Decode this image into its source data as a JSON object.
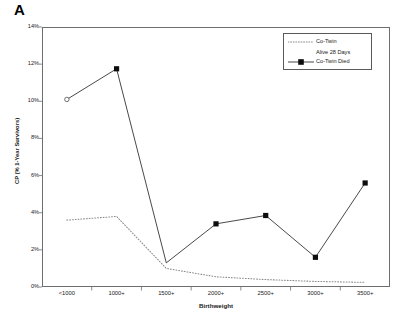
{
  "figure": {
    "panel_label": "A"
  },
  "legend": {
    "position": "top-right",
    "entries": [
      {
        "label_line1": "Co-Twin",
        "label_line2": "Alive 28 Days",
        "style": "dotted",
        "marker": "none"
      },
      {
        "label_line1": "Co-Twin Died",
        "label_line2": "",
        "style": "solid",
        "marker": "filled-square"
      }
    ]
  },
  "chart_data": {
    "type": "line",
    "title": "",
    "subtitle": "",
    "xlabel": "Birthweight",
    "ylabel": "CP (% 1-Year Survivors)",
    "categories": [
      "<1000",
      "1000+",
      "1500+",
      "2000+",
      "2500+",
      "3000+",
      "3500+"
    ],
    "ylim": [
      0,
      14
    ],
    "yticks": [
      0,
      2,
      4,
      6,
      8,
      10,
      12,
      14
    ],
    "ytick_labels": [
      "0%",
      "2%",
      "4%",
      "6%",
      "8%",
      "10%",
      "12%",
      "14%"
    ],
    "ytick_suffix": "%",
    "grid": false,
    "legend_position": "top-right",
    "series": [
      {
        "name": "Co-Twin Alive 28 Days",
        "style": "dotted",
        "marker": "none",
        "color": "#8a8a8a",
        "values": [
          3.6,
          3.8,
          1.0,
          0.55,
          0.4,
          0.3,
          0.25
        ]
      },
      {
        "name": "Co-Twin Died",
        "style": "solid",
        "marker": "filled-square",
        "color": "#1a1a1a",
        "values": [
          10.1,
          11.75,
          1.3,
          3.4,
          3.85,
          1.6,
          5.6
        ],
        "marker_overrides": [
          "open-circle",
          "filled-square",
          "none",
          "filled-square",
          "filled-square",
          "filled-square",
          "filled-square"
        ]
      }
    ]
  }
}
